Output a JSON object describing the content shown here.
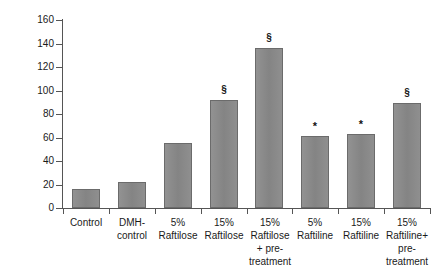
{
  "chart_data": {
    "type": "bar",
    "title": "",
    "xlabel": "",
    "ylabel": "my mol",
    "ylim": [
      0,
      160
    ],
    "ytick_step": 20,
    "yticks": [
      0,
      20,
      40,
      60,
      80,
      100,
      120,
      140,
      160
    ],
    "ytick_labels": [
      "0",
      "20",
      "40",
      "60",
      "80",
      "100",
      "120",
      "140",
      "160"
    ],
    "grid": false,
    "legend": "none",
    "bar_color": "#8c8c8c",
    "bar_edge_color": "#6b6b6b",
    "axis_color": "#555555",
    "categories": [
      "Control",
      "DMH-\ncontrol",
      "5%\nRaftilose",
      "15%\nRaftilose",
      "15%\nRaftilose\n+ pre-\ntreatment",
      "5%\nRaftiline",
      "15%\nRaftiline",
      "15%\nRaftiline+\npre-\ntreatment"
    ],
    "values": [
      16,
      22,
      55,
      92,
      136,
      61,
      63,
      89
    ],
    "annotations": [
      "",
      "",
      "",
      "§",
      "§",
      "*",
      "*",
      "§"
    ],
    "annotation_legend": {
      "section": "§",
      "star": "*"
    }
  }
}
